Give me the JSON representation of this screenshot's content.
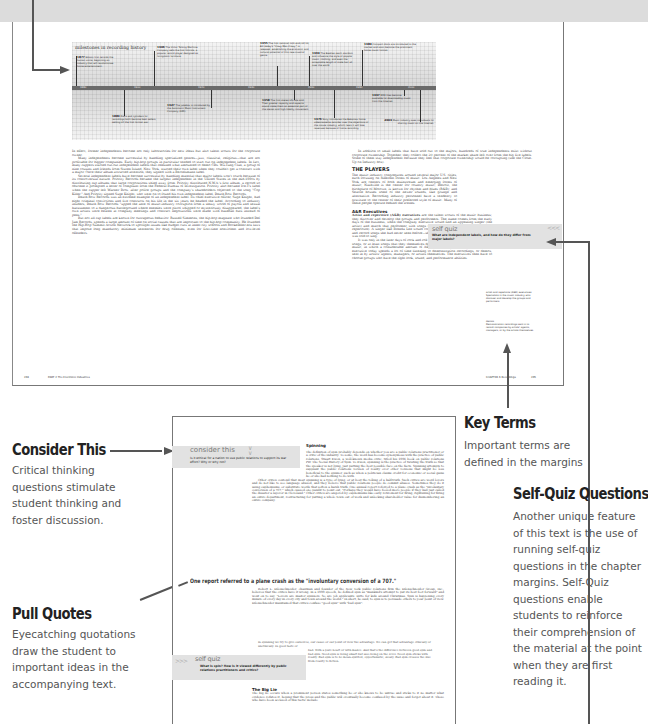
{
  "timeline": {
    "title": "milestones in recording history",
    "years": [
      "1880",
      "1900",
      "1920",
      "1940",
      "1960",
      "1980",
      "2000"
    ],
    "events_above": [
      {
        "year": "1877",
        "text": "Edison first records the human voice, beginning an industry that will revolutionize home entertainment."
      },
      {
        "year": "1906",
        "text": "The Victor Talking Machine Company sells the first Victrola, a popular record player designed as livingroom furniture."
      },
      {
        "year": "1955",
        "text": "The first national rock-and-roll hit, Bill Haley's \"Crazy Man Crazy,\" is released, establishing the economic and cultural potential of this new musical genre."
      },
      {
        "year": "1963",
        "text": "The Beatles reach stardom and influence the style of popular music, clothing, and even the acceptable length of male hair all over the world."
      },
      {
        "year": "1983",
        "text": "Compact discs are introduced to the market and soon become the prominent home music format."
      }
    ],
    "events_below": [
      {
        "year": "1889",
        "text": "Discs and cylinders for recordings both become best sellers, setting off the first format war."
      },
      {
        "year": "1927",
        "text": "The jukebox is introduced by the Automatic Music Instrument Company (AMI)."
      },
      {
        "year": "1958",
        "text": "The first stereo LPs are sold. Their greater capacity and superior sound make them an essential part of the stereo and high-fidelity movement."
      },
      {
        "year": "1976",
        "text": "Sony introduces the Betamax home videocassette recorder over the objections of the movie industry, which fears it will lose revenues because of home recording."
      },
      {
        "year": "1997",
        "text": "MP3 files become available for downloading music from the Internet."
      },
      {
        "year": "2003",
        "text": "Music industry sues individuals for sharing music on the Internet."
      }
    ]
  },
  "upper_spread": {
    "left_column": [
      "In effect, former independents become not only laboratories for new ideas but also talent scouts for the corporate owner.",
      "Many independents become successful by handling specialized genres—jazz, classical, religious—that are not profitable for bigger companies. Early hip-hop groups in particular tended to start out on independent labels. In fact, many rappers started out-out independent labels that released what amounted to demo CDs. Wu-Tang Clan, a group of nine cousins and friends from Staten Island, New York, started their own label when they couldn't get a contract with a major. Once their album attracted attention, they signed with a Bertelsmann label.",
      "Several independent labels have become successful by handling material that major labels won't touch because of its controversial nature. Priority Records became the largest independent in the United States in the mid-1990s by distributing rap albums that large corporations shied away from. Priority distributed N.W.A.'s first album, a record so obscene it prompted a letter of complaint from the Federal Bureau of Investigation. Priority also became Ice-T's label when the rapper left Warner Bros. after police groups and the company's shareholders objected to the song \"Cop Killer.\" And Priority signed Suge Knight, who went on to found his own independent label, Death Row Records.",
      "Death Row Records was an extreme example of an independent label. Its chief executive officer, Suge Knight, had eight criminal convictions and five contracts on his life in the six years he headed the label. According to industry insiders, Death Row Records \"upped the ante of music-industry corruption from a sleazy world of payola and sexual harassment to a dangerous battleground where enemies were pistol whipped or mysteriously disappeared, the label's own artists were beaten at company meetings and contract negotiations were made with baseball bats instead of pens.\"",
      "But not all rap labels are known for outrageous behavior. Russell Simmons, the hip-hop magnate who founded Def Jam Records, spends a large amount of time on social causes that are important to the hip-hop community. He founded the Hip-Hop Summit Action Network to spotlight issues like budget cuts at inner-city schools and Rockefeller-era laws that impose long mandatory minimum sentences for drug offenses, even for first-time nonviolent and low-level offenders."
    ],
    "right_column_intro": "In addition to small labels that have sold out to the majors, hundreds of true independents exist without corporate ownership. Together, they collect the 20 percent of the market share left over from the big five labels. Some of them stay independent because they feel that corporate ownership would be corrupting (see the Close-Up on Industry box).",
    "players_heading": "THE PLAYERS",
    "players_text": "The music industry congregates around several major U.S. cities, each focusing on different forms of music. Los Angeles and New York are centers of both mainstream and emerging forms of music; Nashville is the center for country music; Detroit, the birthplace of Motown, is known for rhythm and blues (R&B); and Seattle houses some of the newer sounds, like grunge and alternative. Recording industry personnel have a tendency to gravitate to the center of their preferred style of music. Many of these people operate behind the scenes.",
    "ar_heading": "A&R Executives",
    "ar_text_bold": "Artist and repertoire (A&R) executives",
    "ar_text": " are the talent scouts of the music business; they discover and develop the groups and performers. The name comes from the early days of the business, when the company executive would find an appealing singer (the artist) and match that performer with songs that had potential to become hits (the repertoire). A singer like Brenda Lee would come into the studio on an appointed day and record songs she had never seen before—she was simply expected to sing what she was told to sing.",
    "ar_text2": "It was only in the later days of rock and roll that performers began to sing their own songs, or at least songs that they themselves decided to sing. One exception is country music, in which a considerable amount of A&R matchmaking is still done. An A&R executive today spends a lot of time listening to demonstration recordings, or demos, sent in by artists' agents, managers, or artists themselves. The executives then have to choose groups who have the right look, sound, and performance abilities.",
    "self_quiz": {
      "title": "self quiz",
      "question": "What are independent labels, and how do they differ from major labels?",
      "chevrons": "<<<"
    },
    "margin_terms": [
      {
        "term": "artist and repertoire (A&R) executives",
        "definition": "Specialists in the music industry who discover and develop the groups and performers."
      },
      {
        "term": "demos",
        "definition": "Demonstration recordings sent in to record companies by artists' agents, managers, or by the artists themselves."
      }
    ],
    "folio_left_page": "204",
    "folio_left_label": "PART 2  The Electronic Industries",
    "folio_right_label": "CHAPTER 6  Recordings",
    "folio_right_page": "205"
  },
  "callouts": {
    "key_terms": {
      "heading": "Key Terms",
      "text": "Important terms are defined in the margins"
    },
    "self_quiz": {
      "heading": "Self-Quiz Questions",
      "text": "Another unique feature of this text is the use of running self-quiz questions in the chapter margins. Self-Quiz questions enable students to reinforce their comprehension of the material at the point when they are first reading it."
    },
    "consider_this": {
      "heading": "Consider This",
      "text": "Critical thinking questions stimulate student thinking and foster discussion."
    },
    "pull_quotes": {
      "heading": "Pull Quotes",
      "text": "Eyecatching quotations draw the student to important ideas in the accompanying text."
    }
  },
  "lower_page": {
    "consider_this": {
      "title": "consider this",
      "question": "Is it ethical for a nation to use public relations to support its war effort? Why or why not?"
    },
    "spinning_heading": "Spinning",
    "spinning_p1": "The definition of spin probably depends on whether you are a public relations practitioner or a critic of the industry. To some, the word has become synonymous with the practice of public relations. Stuart Ewen, a well-known media critic, titled his 1996 book on public relations PR! The Social History of Spin. To Ewen, spinning is the practice of twisting the truth so that the speaker is not lying, just putting the best possible face on the facts. Spinning attempts to supplant the public relations version of reality over other versions that might be less beneficial to the spinner, such as when a politician claims credit for economic or social gains he or she had nothing to do with.",
    "spinning_p2": "Other critics contend that most spinning is a type of lying, or at best the telling of a half-truth. Such critics are word lovers and do not like to see language abused, and they believe that public relations people do commit abuses. Sometimes they do it using euphemisms, or substitute words that soften a harsh truth. One annual report referred to a plane crash as the \"involuntary conversion of a 707,\" which caused one pundit to point out, \"Perhaps they would have fooled more people if they had just called the disaster a layover in Cleveland.\" Other critics are angered by euphemisms like early retirement for firing, rightsizing for firing an entire department, restructuring for putting a whole town out of work and unlocking shareholder value for dismembering an entire company.",
    "pull_quote": "One report referred to a plane crash as the \"involuntary conversion of a 707.\"",
    "spinning_p3": "Robert L. Dilenschneider, chairman and founder of the New York public relations firm the Dilenschneider Group, Inc., believes that the critics have it wrong. In a 1999 speech, he defined spin as \"mankind's attempt to put its best foot forward\" and went on to say, \"Lovers are master spinners. So are job applicants. Ditto for kids around Christmas. Spin is happening every minute of every day in every city and town around the world.\" In short, he said, to spin is to persuade others to your point of view. Dilenschneider maintained that critics confuse \"good spin\" with \"bad spin\":",
    "block_quote_a": "In spinning we try to give ourselves, our cause or our point of view the advantage. We can get that advantage ethically or unethically. In good taste or",
    "block_quote_b": "bad. With a pure heart or with malice. And that's the difference between good spin and bad spin. Good spin is being smart but also being on the level. Good spin sticks with reality. Bad spin is to be mean-spirited, opportunistic, sleazy. Bad spin crosses the line from reality to fiction.",
    "self_quiz": {
      "chevrons": ">>>",
      "title": "self quiz",
      "question": "What is spin? How is it viewed differently by public relations practitioners and critics?"
    },
    "big_lie_heading": "The Big Lie",
    "big_lie_text": "The big lie occurs when a prominent person states something he or she knows to be untrue and sticks to it no matter what evidence refutes it, hoping that the press and the public will eventually become confused by the issue and forget about it. Those who have been accused of this tactic include"
  }
}
